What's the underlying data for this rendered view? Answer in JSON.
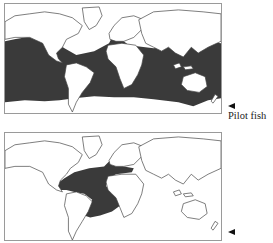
{
  "figure": {
    "type": "species distribution maps",
    "panels": [
      {
        "id": "top",
        "label": "Pilot fish",
        "shaded_region": "Worldwide tropical and temperate oceans (Atlantic, Indian, Pacific) between ~40°N and ~45°S, including Mediterranean",
        "fill_color": "#3a3a3a"
      },
      {
        "id": "bottom",
        "label": "",
        "shaded_region": "Tropical and subtropical Atlantic Ocean, Gulf of Mexico, Caribbean and Mediterranean",
        "fill_color": "#3a3a3a"
      }
    ],
    "land_color": "#ffffff",
    "outline_color": "#444444",
    "arrow_icon": "left-pointing-triangle"
  }
}
